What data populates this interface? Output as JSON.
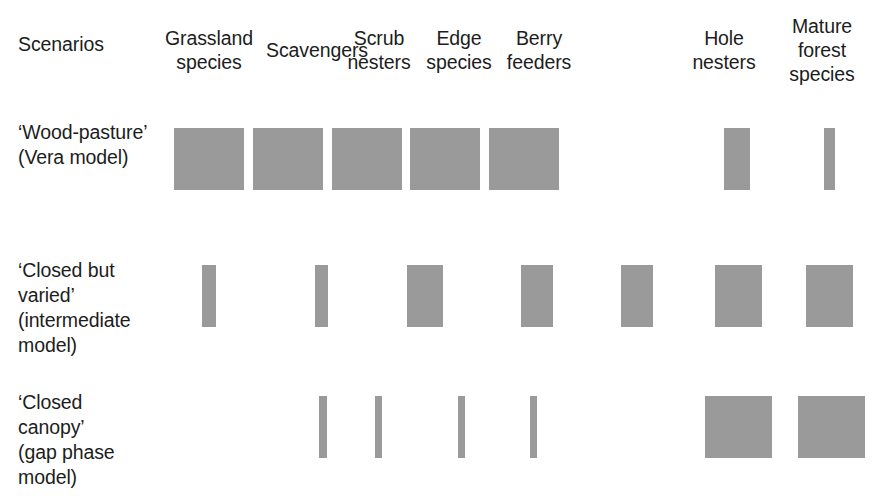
{
  "figure": {
    "row_label_header": "Scenarios",
    "bar_color": "#9a9a9a",
    "background_color": "#ffffff",
    "text_color": "#1d1d1d"
  },
  "columns": [
    {
      "label": "Grassland\nspecies",
      "x": 160,
      "width": 98
    },
    {
      "label": "Scavengers",
      "x": 257,
      "width": 120
    },
    {
      "label": "Scrub\nnesters",
      "x": 330,
      "width": 98
    },
    {
      "label": "Edge\nspecies",
      "x": 410,
      "width": 98
    },
    {
      "label": "Berry\nfeeders",
      "x": 490,
      "width": 98
    },
    {
      "label": "Hole\nnesters",
      "x": 675,
      "width": 98
    },
    {
      "label": "Mature\nforest\nspecies",
      "x": 770,
      "width": 104
    }
  ],
  "rows": [
    {
      "label": "‘Wood-pasture’\n(Vera model)",
      "label_x": 18,
      "label_y": 120,
      "bar_top": 128,
      "bar_height": 62
    },
    {
      "label": "‘Closed but\nvaried’\n(intermediate\nmodel)",
      "label_x": 18,
      "label_y": 258,
      "bar_top": 265,
      "bar_height": 62
    },
    {
      "label": "‘Closed\ncanopy’\n(gap phase\nmodel)",
      "label_x": 18,
      "label_y": 390,
      "bar_top": 396,
      "bar_height": 62
    }
  ],
  "chart_data": {
    "type": "bar",
    "title": "",
    "xlabel": "",
    "ylabel": "",
    "orientation": "matrix-of-bars",
    "grid": false,
    "legend": null,
    "value_unit": "relative abundance (bar width)",
    "categories": [
      "Grassland species",
      "Scavengers",
      "Scrub nesters",
      "Edge species",
      "Berry feeders",
      "Hole nesters",
      "Mature forest species"
    ],
    "series": [
      {
        "name": "‘Wood-pasture’ (Vera model)",
        "values": [
          70,
          70,
          70,
          70,
          70,
          26,
          11
        ]
      },
      {
        "name": "‘Closed but varied’ (intermediate model)",
        "values": [
          14,
          13,
          36,
          32,
          32,
          47,
          47
        ]
      },
      {
        "name": "‘Closed canopy’ (gap phase model)",
        "values": [
          0,
          8,
          7,
          7,
          7,
          67,
          67
        ]
      }
    ],
    "bars": [
      {
        "row": 0,
        "col": 0,
        "x": 174,
        "width": 70,
        "y": 128,
        "height": 62
      },
      {
        "row": 0,
        "col": 1,
        "x": 253,
        "width": 70,
        "y": 128,
        "height": 62
      },
      {
        "row": 0,
        "col": 2,
        "x": 332,
        "width": 70,
        "y": 128,
        "height": 62
      },
      {
        "row": 0,
        "col": 3,
        "x": 410,
        "width": 70,
        "y": 128,
        "height": 62
      },
      {
        "row": 0,
        "col": 4,
        "x": 489,
        "width": 70,
        "y": 128,
        "height": 62
      },
      {
        "row": 0,
        "col": 5,
        "x": 724,
        "width": 26,
        "y": 128,
        "height": 62
      },
      {
        "row": 0,
        "col": 6,
        "x": 824,
        "width": 11,
        "y": 128,
        "height": 62
      },
      {
        "row": 1,
        "col": 0,
        "x": 202,
        "width": 14,
        "y": 265,
        "height": 62
      },
      {
        "row": 1,
        "col": 1,
        "x": 315,
        "width": 13,
        "y": 265,
        "height": 62
      },
      {
        "row": 1,
        "col": 2,
        "x": 407,
        "width": 36,
        "y": 265,
        "height": 62
      },
      {
        "row": 1,
        "col": 3,
        "x": 521,
        "width": 32,
        "y": 265,
        "height": 62
      },
      {
        "row": 1,
        "col": 4,
        "x": 621,
        "width": 32,
        "y": 265,
        "height": 62
      },
      {
        "row": 1,
        "col": 5,
        "x": 715,
        "width": 47,
        "y": 265,
        "height": 62
      },
      {
        "row": 1,
        "col": 6,
        "x": 806,
        "width": 47,
        "y": 265,
        "height": 62
      },
      {
        "row": 2,
        "col": 0,
        "x": 240,
        "width": 0,
        "y": 396,
        "height": 62
      },
      {
        "row": 2,
        "col": 1,
        "x": 319,
        "width": 8,
        "y": 396,
        "height": 62
      },
      {
        "row": 2,
        "col": 2,
        "x": 375,
        "width": 7,
        "y": 396,
        "height": 62
      },
      {
        "row": 2,
        "col": 3,
        "x": 458,
        "width": 7,
        "y": 396,
        "height": 62
      },
      {
        "row": 2,
        "col": 4,
        "x": 530,
        "width": 7,
        "y": 396,
        "height": 62
      },
      {
        "row": 2,
        "col": 5,
        "x": 705,
        "width": 67,
        "y": 396,
        "height": 62
      },
      {
        "row": 2,
        "col": 6,
        "x": 798,
        "width": 67,
        "y": 396,
        "height": 62
      }
    ]
  }
}
